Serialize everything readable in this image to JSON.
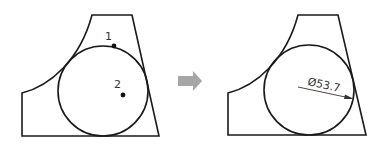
{
  "diagram": {
    "before": {
      "points": [
        {
          "label": "1",
          "x": 114,
          "y": 46
        },
        {
          "label": "2",
          "x": 123,
          "y": 95
        }
      ]
    },
    "arrow": {
      "color": "#a6a6a6"
    },
    "after": {
      "dimension": {
        "text": "Ø53.7"
      }
    }
  }
}
